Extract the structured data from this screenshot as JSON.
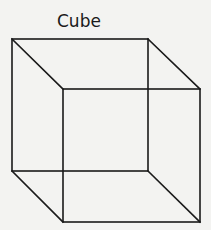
{
  "diagram": {
    "title": "Cube",
    "stroke_color": "#1a1a1a",
    "background": "#f3f3f1",
    "back_face": {
      "x1": 12,
      "y1": 39,
      "x2": 148,
      "y2": 171
    },
    "front_face": {
      "x1": 63,
      "y1": 89,
      "x2": 200,
      "y2": 222
    }
  }
}
